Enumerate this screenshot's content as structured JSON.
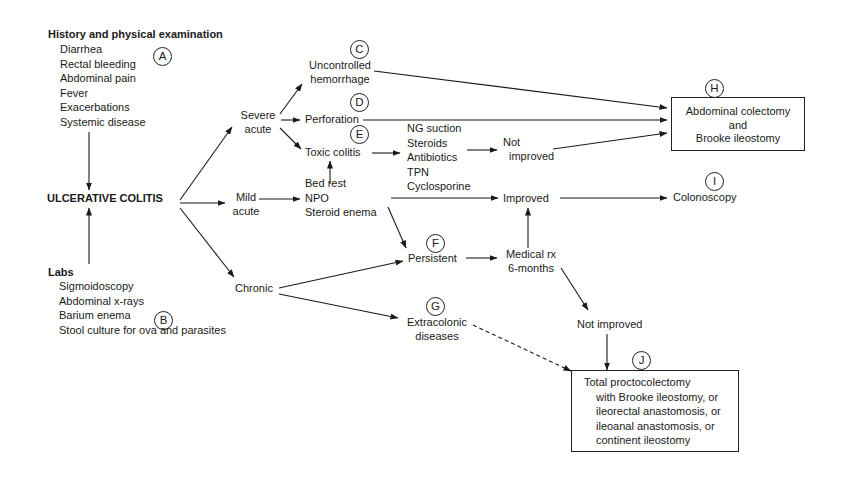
{
  "diagram": {
    "type": "flowchart",
    "history": {
      "heading": "History and physical examination",
      "label": "A",
      "items": [
        "Diarrhea",
        "Rectal bleeding",
        "Abdominal pain",
        "Fever",
        "Exacerbations",
        "Systemic disease"
      ]
    },
    "labs": {
      "heading": "Labs",
      "label": "B",
      "items": [
        "Sigmoidoscopy",
        "Abdominal x-rays",
        "Barium enema",
        "Stool culture for ova and parasites"
      ]
    },
    "central": "ULCERATIVE COLITIS",
    "severe": {
      "line1": "Severe",
      "line2": "acute"
    },
    "mild": {
      "line1": "Mild",
      "line2": "acute"
    },
    "chronic": "Chronic",
    "hemorrhage": {
      "label": "C",
      "line1": "Uncontrolled",
      "line2": "hemorrhage"
    },
    "perforation": {
      "label": "D",
      "text": "Perforation"
    },
    "toxic": {
      "label": "E",
      "text": "Toxic colitis"
    },
    "toxic_treatment": [
      "NG suction",
      "Steroids",
      "Antibiotics",
      "TPN",
      "Cyclosporine"
    ],
    "mild_treatment": [
      "Bed rest",
      "NPO",
      "Steroid enema"
    ],
    "not_improved_1": {
      "line1": "Not",
      "line2": "improved"
    },
    "improved": "Improved",
    "persistent": {
      "label": "F",
      "text": "Persistent"
    },
    "medical": {
      "line1": "Medical rx",
      "line2": "6-months"
    },
    "extracolonic": {
      "label": "G",
      "line1": "Extracolonic",
      "line2": "diseases"
    },
    "not_improved_2": "Not improved",
    "colectomy": {
      "label": "H",
      "lines": [
        "Abdominal colectomy",
        "and",
        "Brooke ileostomy"
      ]
    },
    "colonoscopy": {
      "label": "I",
      "text": "Colonoscopy"
    },
    "proctocolectomy": {
      "label": "J",
      "lines": [
        "Total proctocolectomy",
        "with Brooke ileostomy, or",
        "ileorectal anastomosis, or",
        "ileoanal anastomosis, or",
        "continent ileostomy"
      ]
    }
  }
}
